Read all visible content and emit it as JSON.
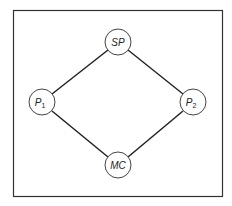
{
  "diagram": {
    "frame": {
      "x": 13,
      "y": 10,
      "width": 209,
      "height": 186,
      "stroke": "#333333"
    },
    "node_radius": 13,
    "nodes": [
      {
        "id": "SP",
        "label": "SP",
        "sub": "",
        "x": 118,
        "y": 42
      },
      {
        "id": "P1",
        "label": "P",
        "sub": "1",
        "x": 42,
        "y": 102
      },
      {
        "id": "P2",
        "label": "P",
        "sub": "2",
        "x": 193,
        "y": 102
      },
      {
        "id": "MC",
        "label": "MC",
        "sub": "",
        "x": 118,
        "y": 165
      }
    ],
    "edges": [
      {
        "from": "SP",
        "to": "P1"
      },
      {
        "from": "SP",
        "to": "P2"
      },
      {
        "from": "P1",
        "to": "MC"
      },
      {
        "from": "P2",
        "to": "MC"
      }
    ]
  }
}
